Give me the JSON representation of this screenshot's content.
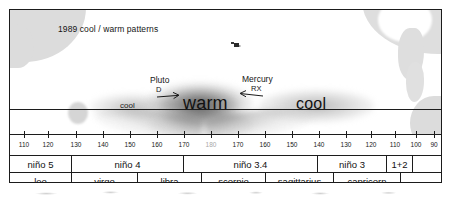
{
  "figure": {
    "title": "1989 cool / warm patterns"
  },
  "map": {
    "labels": {
      "cool_left": "cool",
      "warm_center": "warm",
      "cool_right": "cool"
    },
    "annotations": [
      {
        "name": "Pluto",
        "code": "D",
        "arrow": "arrow-right-icon",
        "direction": "right"
      },
      {
        "name": "Mercury",
        "code": "RX",
        "arrow": "arrow-left-icon",
        "direction": "left"
      }
    ]
  },
  "axis": {
    "label": "longitude",
    "ticks": [
      {
        "label": "110",
        "x": 14,
        "dim": false
      },
      {
        "label": "120",
        "x": 38,
        "dim": false
      },
      {
        "label": "130",
        "x": 66,
        "dim": false
      },
      {
        "label": "140",
        "x": 93,
        "dim": false
      },
      {
        "label": "150",
        "x": 120,
        "dim": false
      },
      {
        "label": "160",
        "x": 147,
        "dim": false
      },
      {
        "label": "170",
        "x": 174,
        "dim": false
      },
      {
        "label": "180",
        "x": 201,
        "dim": true
      },
      {
        "label": "170",
        "x": 228,
        "dim": false
      },
      {
        "label": "160",
        "x": 255,
        "dim": false
      },
      {
        "label": "150",
        "x": 282,
        "dim": false
      },
      {
        "label": "140",
        "x": 309,
        "dim": false
      },
      {
        "label": "130",
        "x": 336,
        "dim": false
      },
      {
        "label": "120",
        "x": 361,
        "dim": false
      },
      {
        "label": "110",
        "x": 385,
        "dim": false
      },
      {
        "label": "100",
        "x": 406,
        "dim": false
      },
      {
        "label": "90",
        "x": 424,
        "dim": false
      },
      {
        "label": "8 0",
        "x": 441,
        "dim": false
      }
    ]
  },
  "nino_row": {
    "name": "nino-regions",
    "cells": [
      {
        "label": "niño 5",
        "width": 62
      },
      {
        "label": "niño 4",
        "width": 112
      },
      {
        "label": "niño 3.4",
        "width": 134
      },
      {
        "label": "niño 3",
        "width": 69
      },
      {
        "label": "1+2",
        "width": 26
      },
      {
        "label": "",
        "width": 28
      }
    ]
  },
  "zodiac_row": {
    "name": "zodiac-signs",
    "cells": [
      {
        "label": "leo",
        "width": 62
      },
      {
        "label": "virgo",
        "width": 66
      },
      {
        "label": "libra",
        "width": 64
      },
      {
        "label": "scorpio",
        "width": 64
      },
      {
        "label": "sagittarius",
        "width": 68
      },
      {
        "label": "capricorn",
        "width": 67
      },
      {
        "label": "",
        "width": 40
      }
    ]
  },
  "colors": {
    "ink": "#1c1c1c",
    "land": "#dcdcdc",
    "anomaly_warm": "#5a5a5a",
    "anomaly_cool": "#969696",
    "tick_dim": "#a8a8a8",
    "paper": "#ffffff"
  }
}
